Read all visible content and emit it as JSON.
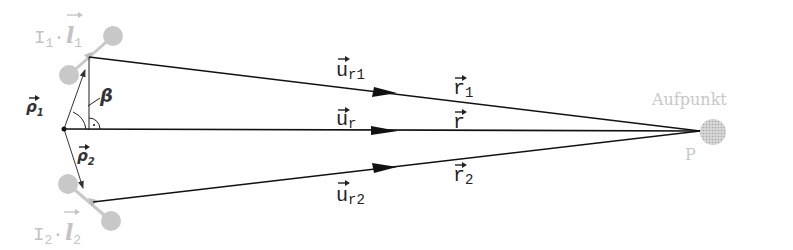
{
  "diagram": {
    "title": "",
    "colors": {
      "line": "#111111",
      "element": "#c8c8c8",
      "element_text": "#c4c4c4",
      "thin_arrow": "#333333"
    },
    "elements": {
      "upper": {
        "current": "I",
        "current_sub": "1",
        "dot": "·",
        "length": "l",
        "length_sub": "1"
      },
      "lower": {
        "current": "I",
        "current_sub": "2",
        "dot": "·",
        "length": "l",
        "length_sub": "2"
      }
    },
    "position_vectors": {
      "rho1": {
        "symbol": "ρ",
        "sub": "1"
      },
      "rho2": {
        "symbol": "ρ",
        "sub": "2"
      }
    },
    "angle": {
      "symbol": "β"
    },
    "right_angle_marker": "·",
    "unit_vectors": {
      "ur1": {
        "symbol": "u",
        "sub": "r1"
      },
      "ur": {
        "symbol": "u",
        "sub": "r"
      },
      "ur2": {
        "symbol": "u",
        "sub": "r2"
      }
    },
    "distance_vectors": {
      "r1": {
        "symbol": "r",
        "sub": "1"
      },
      "r": {
        "symbol": "r",
        "sub": ""
      },
      "r2": {
        "symbol": "r",
        "sub": "2"
      }
    },
    "point": {
      "label": "P",
      "caption": "Aufpunkt"
    }
  }
}
